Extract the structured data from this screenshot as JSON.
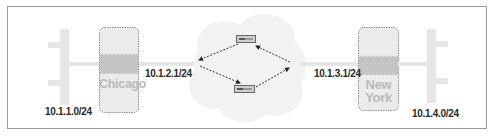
{
  "diagram": {
    "type": "network-topology",
    "colors": {
      "frame_border": "#9a9a9a",
      "lan_bus": "#e6e6e6",
      "router_box_fill": "#ebebeb",
      "router_box_border": "#8c8c8c",
      "router_band": "#c4c4c4",
      "cloud_fill": "#f1f1f1",
      "link_dashed": "#333333",
      "label_text": "#2a2a2a",
      "site_text": "#b9b9b9"
    },
    "left_network": {
      "subnet_label": "10.1.1.0/24"
    },
    "chicago_router": {
      "name": "Chicago",
      "interface_label": "10.1.2.1/24"
    },
    "wan_cloud": {
      "routers": [
        {
          "id": "top-router"
        },
        {
          "id": "bottom-router"
        }
      ]
    },
    "newyork_router": {
      "name_line1": "New",
      "name_line2": "York",
      "interface_label": "10.1.3.1/24"
    },
    "right_network": {
      "subnet_label": "10.1.4.0/24"
    }
  }
}
